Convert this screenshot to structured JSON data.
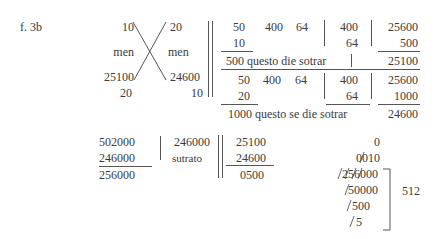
{
  "label": "f. 3b",
  "cross": {
    "top_left": "10",
    "top_right": "20",
    "mid_left": "men",
    "mid_right": "men",
    "bottom_left": "25100",
    "bottom_right": "24600",
    "foot_left": "20",
    "foot_right": "10"
  },
  "block1": {
    "row1": [
      "50",
      "400",
      "64"
    ],
    "row2": "10",
    "mid_top": "400",
    "mid_bottom": "64",
    "right_top": "25600",
    "right_bottom": "500",
    "caption": "500 questo die sotrar",
    "result": "25100"
  },
  "block2": {
    "row1": [
      "50",
      "400",
      "64"
    ],
    "row2": "20",
    "mid_top": "400",
    "mid_bottom": "64",
    "right_top": "25600",
    "right_bottom": "1000",
    "caption": "1000 questo se die sotrar",
    "result": "24600"
  },
  "subtraction1": {
    "top": "502000",
    "bottom": "246000",
    "result": "256000",
    "side_value": "246000",
    "side_label": "sutrato"
  },
  "subtraction2": {
    "top": "25100",
    "bottom": "24600",
    "result": "0500"
  },
  "galley": {
    "lines": [
      "0",
      "0010",
      "256000",
      "50000",
      "500",
      "5"
    ],
    "quotient": "512"
  }
}
